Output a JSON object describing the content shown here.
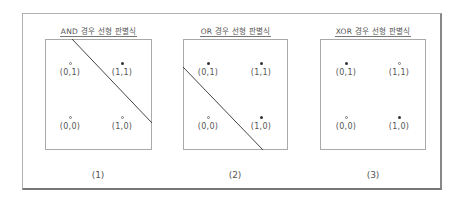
{
  "panels": [
    {
      "title": "AND 경우 선형 판별식",
      "caption": "(1)",
      "points": [
        {
          "label": "(0,1)",
          "value": "0",
          "marker": "hollow"
        },
        {
          "label": "(1,1)",
          "value": "1",
          "marker": "filled"
        },
        {
          "label": "(0,0)",
          "value": "0",
          "marker": "hollow"
        },
        {
          "label": "(1,0)",
          "value": "0",
          "marker": "hollow"
        }
      ],
      "boundary_line": {
        "x1": 27,
        "y1": 0,
        "x2": 107,
        "y2": 84
      }
    },
    {
      "title": "OR 경우 선형 판별식",
      "caption": "(2)",
      "points": [
        {
          "label": "(0,1)",
          "value": "1",
          "marker": "filled"
        },
        {
          "label": "(1,1)",
          "value": "1",
          "marker": "filled"
        },
        {
          "label": "(0,0)",
          "value": "0",
          "marker": "hollow"
        },
        {
          "label": "(1,0)",
          "value": "1",
          "marker": "filled"
        }
      ],
      "boundary_line": {
        "x1": 0,
        "y1": 28,
        "x2": 80,
        "y2": 111
      }
    },
    {
      "title": "XOR 경우 선형 판별식",
      "caption": "(3)",
      "points": [
        {
          "label": "(0,1)",
          "value": "1",
          "marker": "filled"
        },
        {
          "label": "(1,1)",
          "value": "0",
          "marker": "hollow"
        },
        {
          "label": "(0,0)",
          "value": "0",
          "marker": "hollow"
        },
        {
          "label": "(1,0)",
          "value": "1",
          "marker": "filled"
        }
      ],
      "boundary_line": null
    }
  ],
  "colors": {
    "line": "#444444",
    "border": "#aaaaaa",
    "filled_marker": "#333333",
    "hollow_marker": "#777777"
  }
}
